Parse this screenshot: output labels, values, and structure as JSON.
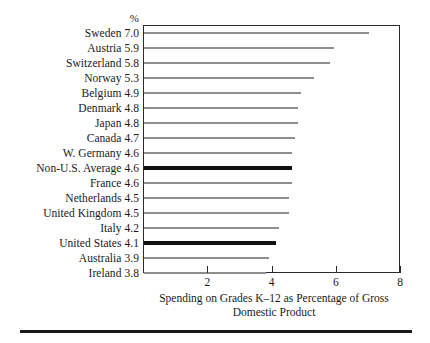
{
  "chart_data": {
    "type": "bar",
    "orientation": "horizontal",
    "title": "",
    "unit_header": "%",
    "xlabel": "Spending on Grades K–12 as Percentage of Gross Domestic Product",
    "xlabel_lines": [
      "Spending on Grades K–12 as Percentage of Gross",
      "Domestic Product"
    ],
    "ylabel": "",
    "xlim": [
      0,
      8
    ],
    "xticks": [
      2,
      4,
      6,
      8
    ],
    "xticklabels": [
      "2",
      "4",
      "6",
      "8"
    ],
    "grid": false,
    "legend": null,
    "categories": [
      "Sweden",
      "Austria",
      "Switzerland",
      "Norway",
      "Belgium",
      "Denmark",
      "Japan",
      "Canada",
      "W. Germany",
      "Non-U.S. Average",
      "France",
      "Netherlands",
      "United Kingdom",
      "Italy",
      "United States",
      "Australia",
      "Ireland"
    ],
    "values": [
      7.0,
      5.9,
      5.8,
      5.3,
      4.9,
      4.8,
      4.8,
      4.7,
      4.6,
      4.6,
      4.6,
      4.5,
      4.5,
      4.2,
      4.1,
      3.9,
      3.8
    ],
    "value_labels": [
      "7.0",
      "5.9",
      "5.8",
      "5.3",
      "4.9",
      "4.8",
      "4.8",
      "4.7",
      "4.6",
      "4.6",
      "4.6",
      "4.5",
      "4.5",
      "4.2",
      "4.1",
      "3.9",
      "3.8"
    ],
    "highlighted": [
      "Non-U.S. Average",
      "United States"
    ],
    "colors": {
      "bar": "#8e8e8e",
      "bar_highlight": "#111111",
      "frame": "#2b2b2b",
      "text": "#1a1a1a",
      "background": "#ffffff",
      "rule": "#1a1a1a"
    }
  }
}
